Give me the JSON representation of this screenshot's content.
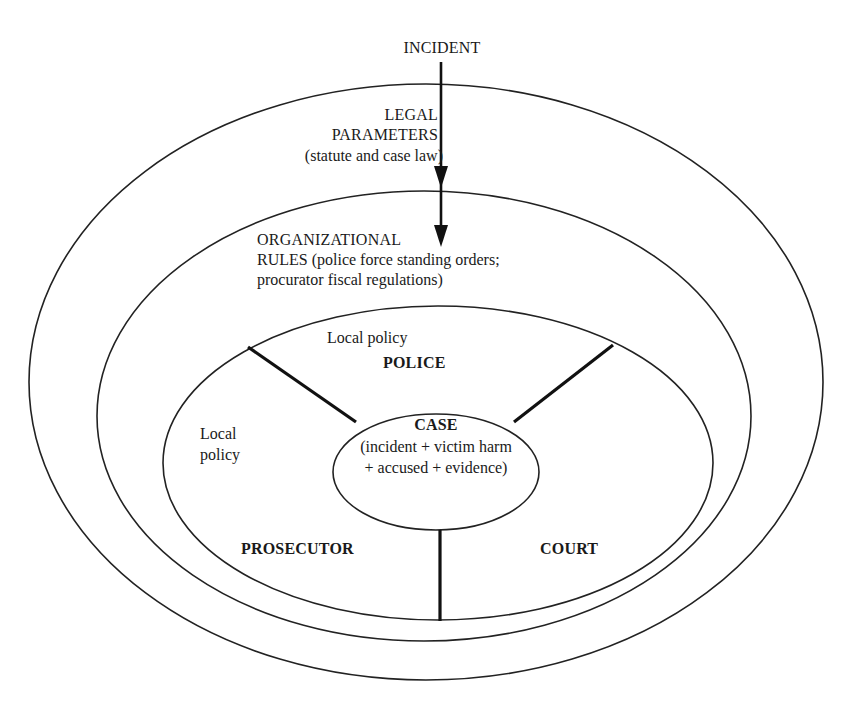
{
  "diagram": {
    "type": "nested-ellipse",
    "nodes": {
      "incident": {
        "label": "INCIDENT"
      },
      "legal_parameters": {
        "line1": "LEGAL",
        "line2": "PARAMETERS",
        "line3": "(statute and case law)"
      },
      "organizational_rules": {
        "line1": "ORGANIZATIONAL",
        "line2": "RULES (police force standing orders;",
        "line3": "procurator fiscal regulations)"
      },
      "police": {
        "local_policy": "Local policy",
        "label": "POLICE"
      },
      "prosecutor": {
        "local_policy_line1": "Local",
        "local_policy_line2": "policy",
        "label": "PROSECUTOR"
      },
      "court": {
        "label": "COURT"
      },
      "case": {
        "title": "CASE",
        "line1": "(incident + victim harm",
        "line2": "+ accused + evidence)"
      }
    },
    "edges": [
      {
        "from": "INCIDENT",
        "to": "LEGAL PARAMETERS",
        "type": "arrow"
      },
      {
        "from": "LEGAL PARAMETERS",
        "to": "ORGANIZATIONAL RULES",
        "type": "arrow"
      }
    ],
    "colors": {
      "stroke": "#222222",
      "background": "#ffffff",
      "text": "#1a1a1a"
    }
  }
}
